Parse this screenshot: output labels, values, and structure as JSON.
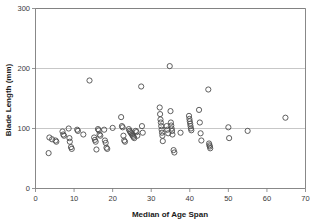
{
  "chart_data": {
    "type": "scatter",
    "title": "",
    "xlabel": "Median of Age Span",
    "ylabel": "Blade Length (mm)",
    "xlim": [
      0,
      70
    ],
    "ylim": [
      0,
      300
    ],
    "xticks": [
      0,
      10,
      20,
      30,
      40,
      50,
      60,
      70
    ],
    "yticks": [
      0,
      100,
      200,
      300
    ],
    "grid": "horizontal",
    "legend": "none",
    "marker": "open-circle",
    "marker_color": "#4d4d4d",
    "series": [
      {
        "name": "blade length vs median age span",
        "points": [
          [
            3.4,
            59
          ],
          [
            3.6,
            85
          ],
          [
            4.3,
            82
          ],
          [
            5.2,
            80
          ],
          [
            5.4,
            78
          ],
          [
            7.0,
            95
          ],
          [
            7.2,
            90
          ],
          [
            7.4,
            88
          ],
          [
            8.6,
            100
          ],
          [
            8.8,
            84
          ],
          [
            8.9,
            78
          ],
          [
            9.2,
            69
          ],
          [
            9.4,
            66
          ],
          [
            10.8,
            98
          ],
          [
            11.0,
            96
          ],
          [
            12.4,
            90
          ],
          [
            14.0,
            180
          ],
          [
            15.2,
            85
          ],
          [
            15.4,
            81
          ],
          [
            15.6,
            78
          ],
          [
            15.8,
            65
          ],
          [
            16.2,
            99
          ],
          [
            16.4,
            97
          ],
          [
            16.6,
            90
          ],
          [
            16.8,
            88
          ],
          [
            17.8,
            98
          ],
          [
            18.0,
            80
          ],
          [
            18.2,
            76
          ],
          [
            18.4,
            68
          ],
          [
            18.6,
            66
          ],
          [
            20.0,
            101
          ],
          [
            22.2,
            119
          ],
          [
            22.4,
            104
          ],
          [
            22.6,
            102
          ],
          [
            22.8,
            88
          ],
          [
            23.0,
            80
          ],
          [
            23.2,
            78
          ],
          [
            24.2,
            99
          ],
          [
            24.4,
            96
          ],
          [
            24.6,
            94
          ],
          [
            24.8,
            92
          ],
          [
            25.0,
            90
          ],
          [
            25.2,
            88
          ],
          [
            25.4,
            86
          ],
          [
            25.6,
            84
          ],
          [
            26.0,
            96
          ],
          [
            26.2,
            94
          ],
          [
            26.4,
            88
          ],
          [
            27.4,
            170
          ],
          [
            27.6,
            104
          ],
          [
            27.8,
            93
          ],
          [
            32.2,
            135
          ],
          [
            32.3,
            124
          ],
          [
            32.4,
            115
          ],
          [
            32.5,
            110
          ],
          [
            32.6,
            104
          ],
          [
            32.7,
            98
          ],
          [
            32.8,
            93
          ],
          [
            32.9,
            88
          ],
          [
            33.0,
            79
          ],
          [
            34.0,
            104
          ],
          [
            34.2,
            98
          ],
          [
            34.4,
            92
          ],
          [
            34.8,
            204
          ],
          [
            35.0,
            129
          ],
          [
            35.1,
            110
          ],
          [
            35.2,
            105
          ],
          [
            35.3,
            100
          ],
          [
            35.4,
            96
          ],
          [
            35.5,
            90
          ],
          [
            35.8,
            64
          ],
          [
            36.0,
            60
          ],
          [
            37.6,
            93
          ],
          [
            39.8,
            121
          ],
          [
            39.9,
            116
          ],
          [
            40.0,
            112
          ],
          [
            40.1,
            108
          ],
          [
            40.2,
            104
          ],
          [
            40.3,
            100
          ],
          [
            40.4,
            97
          ],
          [
            42.4,
            131
          ],
          [
            42.6,
            110
          ],
          [
            42.8,
            92
          ],
          [
            43.0,
            80
          ],
          [
            44.8,
            165
          ],
          [
            45.0,
            75
          ],
          [
            45.1,
            72
          ],
          [
            45.2,
            70
          ],
          [
            45.3,
            67
          ],
          [
            50.0,
            102
          ],
          [
            50.2,
            84
          ],
          [
            55.0,
            96
          ],
          [
            64.8,
            118
          ]
        ]
      }
    ]
  }
}
